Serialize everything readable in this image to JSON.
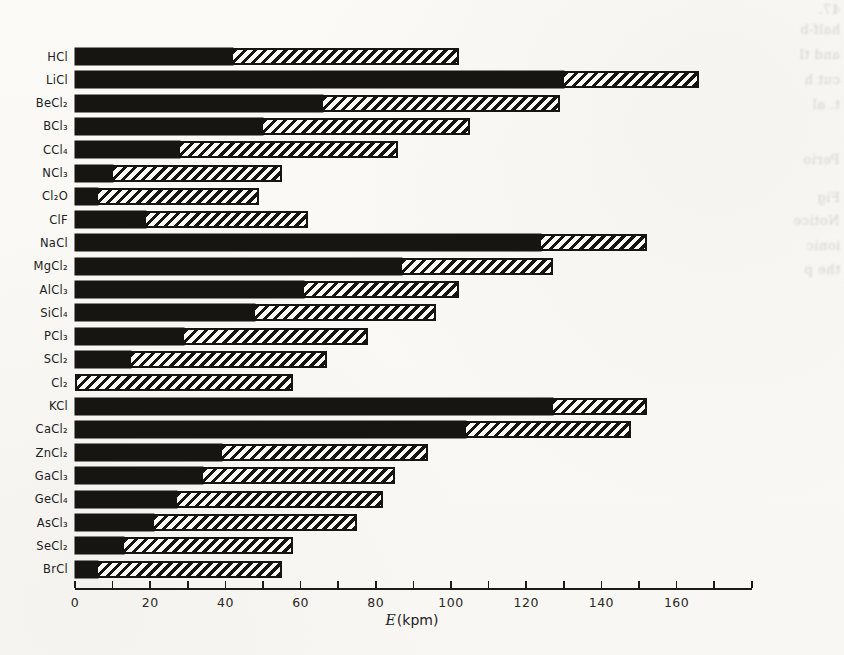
{
  "figure": {
    "axis_label": {
      "e": "E",
      "unit": "(kpm)"
    }
  },
  "chart_data": {
    "type": "bar",
    "orientation": "horizontal",
    "stacked": true,
    "title": "",
    "xlabel": "E (kpm)",
    "ylabel": "",
    "xlim": [
      0,
      180
    ],
    "x_major_ticks": [
      0,
      20,
      40,
      60,
      80,
      100,
      120,
      140,
      160
    ],
    "x_minor_tick_step": 10,
    "grid": false,
    "legend_position": "none",
    "categories": [
      "HCl",
      "LiCl",
      "BeCl₂",
      "BCl₃",
      "CCl₄",
      "NCl₃",
      "Cl₂O",
      "ClF",
      "NaCl",
      "MgCl₂",
      "AlCl₃",
      "SiCl₄",
      "PCl₃",
      "SCl₂",
      "Cl₂",
      "KCl",
      "CaCl₂",
      "ZnCl₂",
      "GaCl₃",
      "GeCl₄",
      "AsCl₃",
      "SeCl₂",
      "BrCl"
    ],
    "series": [
      {
        "name": "solid-black-segment",
        "style": "solid",
        "values": [
          42,
          130,
          66,
          50,
          28,
          10,
          6,
          19,
          124,
          87,
          61,
          48,
          29,
          15,
          0,
          127,
          104,
          39,
          34,
          27,
          21,
          13,
          6
        ]
      },
      {
        "name": "hatched-segment",
        "style": "diagonal-hatch",
        "values": [
          60,
          36,
          63,
          55,
          58,
          45,
          43,
          43,
          28,
          40,
          41,
          48,
          49,
          52,
          58,
          25,
          44,
          55,
          51,
          55,
          54,
          45,
          49
        ]
      }
    ],
    "totals": [
      102,
      166,
      129,
      105,
      86,
      55,
      49,
      62,
      152,
      127,
      102,
      96,
      78,
      67,
      58,
      152,
      148,
      94,
      85,
      82,
      75,
      58,
      55
    ]
  },
  "margin_text": {
    "fragments": [
      {
        "text": "47.",
        "top": 2
      },
      {
        "text": "half-b",
        "top": 22
      },
      {
        "text": "and tl",
        "top": 47
      },
      {
        "text": "cut h",
        "top": 72
      },
      {
        "text": "t. al",
        "top": 97
      },
      {
        "text": "Perio",
        "top": 152
      },
      {
        "text": "Fig",
        "top": 190
      },
      {
        "text": "Notice",
        "top": 213
      },
      {
        "text": "ionic",
        "top": 238
      },
      {
        "text": "the p",
        "top": 262
      }
    ]
  }
}
